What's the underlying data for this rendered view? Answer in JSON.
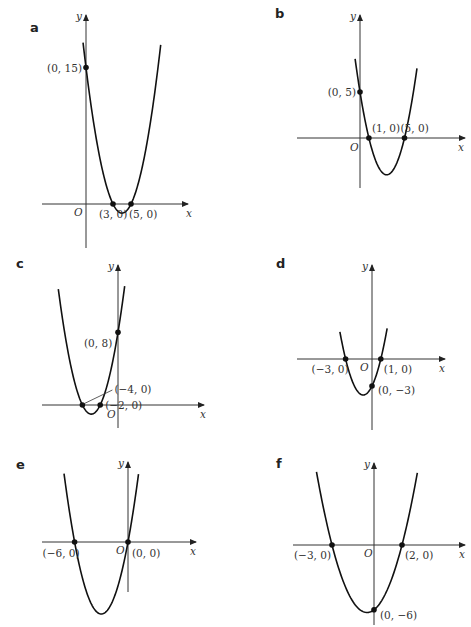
{
  "chart_data": [
    {
      "type": "line",
      "panel": "a",
      "title": "a",
      "xlabel": "x",
      "ylabel": "y",
      "origin_label": "O",
      "equation_roots": [
        3,
        5
      ],
      "y_intercept": 15,
      "points": [
        {
          "x": 0,
          "y": 15,
          "label": "(0, 15)"
        },
        {
          "x": 3,
          "y": 0,
          "label": "(3, 0)"
        },
        {
          "x": 5,
          "y": 0,
          "label": "(5, 0)"
        }
      ]
    },
    {
      "type": "line",
      "panel": "b",
      "title": "b",
      "xlabel": "x",
      "ylabel": "y",
      "origin_label": "O",
      "equation_roots": [
        1,
        5
      ],
      "y_intercept": 5,
      "points": [
        {
          "x": 0,
          "y": 5,
          "label": "(0, 5)"
        },
        {
          "x": 1,
          "y": 0,
          "label": "(1, 0)"
        },
        {
          "x": 5,
          "y": 0,
          "label": "(5, 0)"
        }
      ]
    },
    {
      "type": "line",
      "panel": "c",
      "title": "c",
      "xlabel": "x",
      "ylabel": "y",
      "origin_label": "O",
      "equation_roots": [
        -4,
        -2
      ],
      "y_intercept": 8,
      "points": [
        {
          "x": 0,
          "y": 8,
          "label": "(0, 8)"
        },
        {
          "x": -4,
          "y": 0,
          "label": "(−4, 0)"
        },
        {
          "x": -2,
          "y": 0,
          "label": "(−2, 0)"
        }
      ]
    },
    {
      "type": "line",
      "panel": "d",
      "title": "d",
      "xlabel": "x",
      "ylabel": "y",
      "origin_label": "O",
      "equation_roots": [
        -3,
        1
      ],
      "y_intercept": -3,
      "points": [
        {
          "x": -3,
          "y": 0,
          "label": "(−3, 0)"
        },
        {
          "x": 1,
          "y": 0,
          "label": "(1, 0)"
        },
        {
          "x": 0,
          "y": -3,
          "label": "(0, −3)"
        }
      ]
    },
    {
      "type": "line",
      "panel": "e",
      "title": "e",
      "xlabel": "x",
      "ylabel": "y",
      "origin_label": "O",
      "equation_roots": [
        -6,
        0
      ],
      "y_intercept": 0,
      "points": [
        {
          "x": -6,
          "y": 0,
          "label": "(−6, 0)"
        },
        {
          "x": 0,
          "y": 0,
          "label": "(0, 0)"
        }
      ]
    },
    {
      "type": "line",
      "panel": "f",
      "title": "f",
      "xlabel": "x",
      "ylabel": "y",
      "origin_label": "O",
      "equation_roots": [
        -3,
        2
      ],
      "y_intercept": -6,
      "points": [
        {
          "x": -3,
          "y": 0,
          "label": "(−3, 0)"
        },
        {
          "x": 2,
          "y": 0,
          "label": "(2, 0)"
        },
        {
          "x": 0,
          "y": -6,
          "label": "(0, −6)"
        }
      ]
    }
  ],
  "colors": {
    "curve": "#111111",
    "axis": "#333333",
    "text": "#333333",
    "background": "#ffffff"
  }
}
